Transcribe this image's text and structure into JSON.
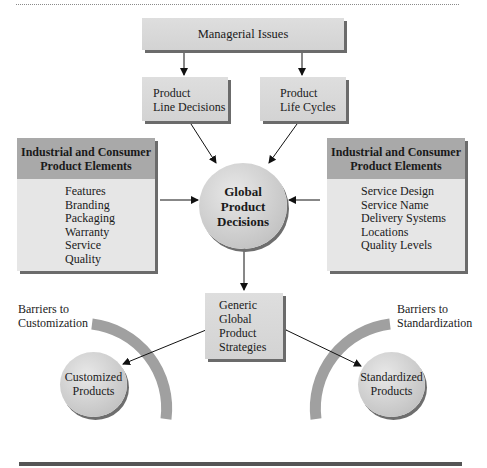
{
  "diagram": {
    "top_node": {
      "label": "Managerial Issues"
    },
    "sub_nodes": [
      {
        "lines": [
          "Product",
          "Line Decisions"
        ]
      },
      {
        "lines": [
          "Product",
          "Life Cycles"
        ]
      }
    ],
    "center_node": {
      "lines": [
        "Global",
        "Product",
        "Decisions"
      ]
    },
    "left_elements": {
      "title_lines": [
        "Industrial and Consumer",
        "Product Elements"
      ],
      "items": [
        "Features",
        "Branding",
        "Packaging",
        "Warranty",
        "Service",
        "Quality"
      ]
    },
    "right_elements": {
      "title_lines": [
        "Industrial and Consumer",
        "Product Elements"
      ],
      "items": [
        "Service Design",
        "Service Name",
        "Delivery Systems",
        "Locations",
        "Quality Levels"
      ]
    },
    "strategies_node": {
      "lines": [
        "Generic",
        "Global",
        "Product",
        "Strategies"
      ]
    },
    "left_outcome": {
      "barrier_lines": [
        "Barriers to",
        "Customization"
      ],
      "circle_lines": [
        "Customized",
        "Products"
      ]
    },
    "right_outcome": {
      "barrier_lines": [
        "Barriers to",
        "Standardization"
      ],
      "circle_lines": [
        "Standardized",
        "Products"
      ]
    },
    "colors": {
      "box_fill": "#d9d9d9",
      "box_shadow": "#6b6b6b",
      "header_fill": "#a9a9a9",
      "arc_fill": "#9e9e9e",
      "bottom_bar": "#555555"
    }
  }
}
